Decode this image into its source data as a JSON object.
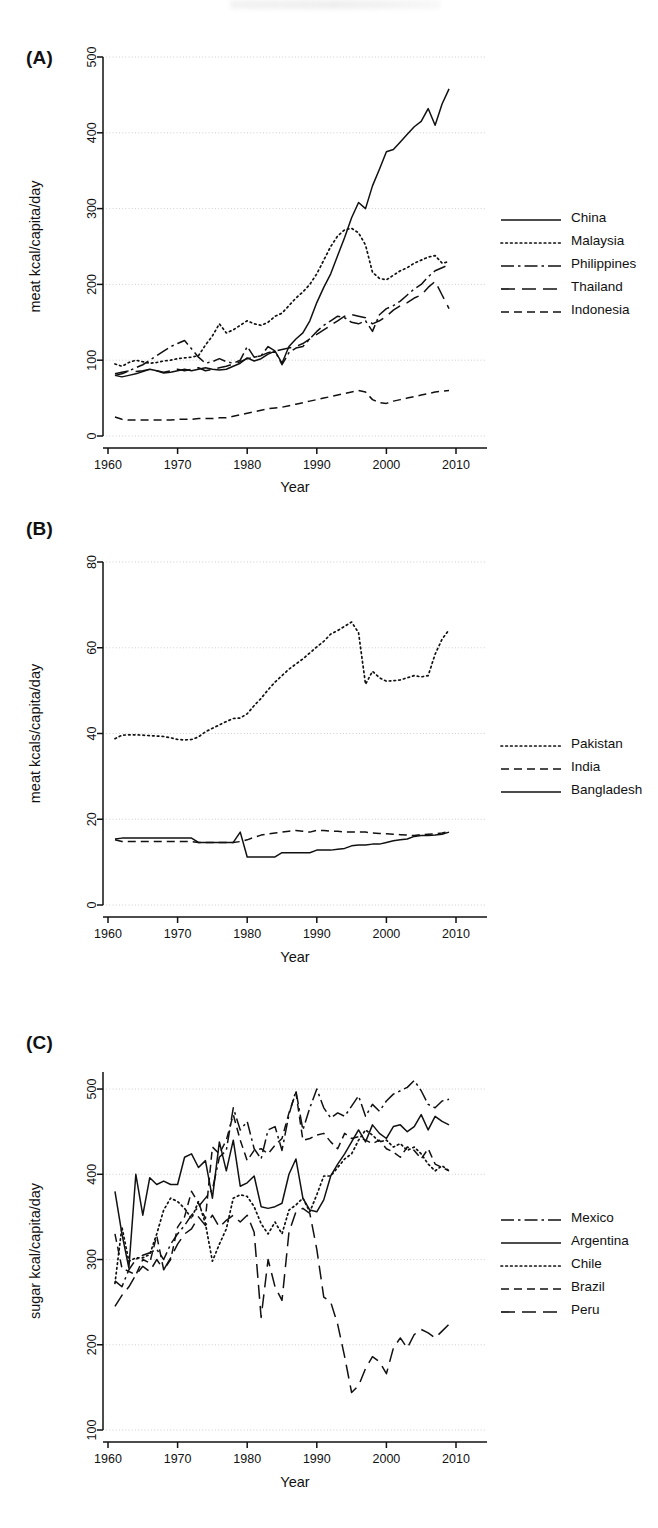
{
  "figure": {
    "panels": [
      "A",
      "B",
      "C"
    ],
    "shared_xlabel": "Year",
    "x_ticks": [
      1960,
      1970,
      1980,
      1990,
      2000,
      2010
    ],
    "line_color": "#111111"
  },
  "panel_a": {
    "tag": "(A)",
    "legend": [
      {
        "label": "China",
        "style": "solid"
      },
      {
        "label": "Malaysia",
        "style": "dotted"
      },
      {
        "label": "Philippines",
        "style": "dash-dot"
      },
      {
        "label": "Thailand",
        "style": "long-dash"
      },
      {
        "label": "Indonesia",
        "style": "dashed"
      }
    ]
  },
  "panel_b": {
    "tag": "(B)",
    "legend": [
      {
        "label": "Pakistan",
        "style": "dotted"
      },
      {
        "label": "India",
        "style": "dashed"
      },
      {
        "label": "Bangladesh",
        "style": "solid"
      }
    ]
  },
  "panel_c": {
    "tag": "(C)",
    "legend": [
      {
        "label": "Mexico",
        "style": "dash-dot"
      },
      {
        "label": "Argentina",
        "style": "solid"
      },
      {
        "label": "Chile",
        "style": "dotted"
      },
      {
        "label": "Brazil",
        "style": "dashed"
      },
      {
        "label": "Peru",
        "style": "long-dash"
      }
    ]
  },
  "chart_data": [
    {
      "type": "line",
      "panel": "A",
      "title": "",
      "xlabel": "Year",
      "ylabel": "meat kcal/capita/day",
      "xlim": [
        1960,
        2012
      ],
      "ylim": [
        0,
        500
      ],
      "xticks": [
        1960,
        1970,
        1980,
        1990,
        2000,
        2010
      ],
      "yticks": [
        0,
        100,
        200,
        300,
        400,
        500
      ],
      "grid": true,
      "legend_position": "right",
      "x": [
        1961,
        1962,
        1963,
        1964,
        1965,
        1966,
        1967,
        1968,
        1969,
        1970,
        1971,
        1972,
        1973,
        1974,
        1975,
        1976,
        1977,
        1978,
        1979,
        1980,
        1981,
        1982,
        1983,
        1984,
        1985,
        1986,
        1987,
        1988,
        1989,
        1990,
        1991,
        1992,
        1993,
        1994,
        1995,
        1996,
        1997,
        1998,
        1999,
        2000,
        2001,
        2002,
        2003,
        2004,
        2005,
        2006,
        2007,
        2008,
        2009
      ],
      "series": [
        {
          "name": "China",
          "style": "solid",
          "values": [
            80,
            78,
            80,
            82,
            85,
            88,
            86,
            83,
            84,
            86,
            88,
            86,
            88,
            90,
            88,
            87,
            88,
            92,
            96,
            103,
            99,
            102,
            108,
            112,
            96,
            118,
            128,
            136,
            152,
            176,
            196,
            214,
            238,
            262,
            288,
            308,
            300,
            330,
            352,
            375,
            378,
            388,
            398,
            408,
            415,
            432,
            410,
            438,
            458
          ]
        },
        {
          "name": "Malaysia",
          "style": "dotted",
          "values": [
            95,
            92,
            97,
            100,
            98,
            96,
            97,
            99,
            100,
            102,
            103,
            104,
            106,
            120,
            132,
            148,
            136,
            140,
            146,
            152,
            148,
            146,
            150,
            158,
            162,
            172,
            182,
            190,
            200,
            214,
            232,
            250,
            264,
            272,
            274,
            268,
            252,
            216,
            208,
            206,
            212,
            218,
            222,
            228,
            232,
            236,
            238,
            228,
            230
          ]
        },
        {
          "name": "Philippines",
          "style": "dash-dot",
          "values": [
            80,
            82,
            86,
            90,
            94,
            100,
            106,
            112,
            118,
            122,
            126,
            115,
            104,
            96,
            98,
            102,
            98,
            96,
            100,
            118,
            104,
            106,
            118,
            112,
            94,
            110,
            116,
            118,
            128,
            138,
            146,
            152,
            158,
            156,
            150,
            148,
            152,
            138,
            160,
            168,
            172,
            178,
            186,
            194,
            200,
            210,
            218,
            222,
            226
          ]
        },
        {
          "name": "Thailand",
          "style": "long-dash",
          "values": [
            82,
            84,
            86,
            85,
            86,
            88,
            86,
            84,
            86,
            88,
            86,
            88,
            90,
            86,
            88,
            90,
            92,
            95,
            98,
            102,
            104,
            106,
            110,
            112,
            114,
            116,
            118,
            122,
            128,
            134,
            140,
            146,
            152,
            158,
            160,
            158,
            156,
            148,
            152,
            158,
            166,
            172,
            176,
            182,
            186,
            196,
            204,
            186,
            168
          ]
        },
        {
          "name": "Indonesia",
          "style": "dashed",
          "values": [
            25,
            22,
            21,
            21,
            21,
            21,
            21,
            21,
            21,
            22,
            22,
            22,
            23,
            23,
            23,
            24,
            24,
            26,
            28,
            30,
            32,
            34,
            36,
            37,
            38,
            40,
            42,
            44,
            46,
            48,
            50,
            52,
            54,
            56,
            58,
            60,
            58,
            48,
            44,
            43,
            46,
            48,
            50,
            52,
            54,
            56,
            58,
            59,
            60
          ]
        }
      ]
    },
    {
      "type": "line",
      "panel": "B",
      "title": "",
      "xlabel": "Year",
      "ylabel": "meat kcals/capita/day",
      "xlim": [
        1960,
        2012
      ],
      "ylim": [
        0,
        80
      ],
      "xticks": [
        1960,
        1970,
        1980,
        1990,
        2000,
        2010
      ],
      "yticks": [
        0,
        20,
        40,
        60,
        80
      ],
      "grid": true,
      "legend_position": "right",
      "x": [
        1961,
        1962,
        1963,
        1964,
        1965,
        1966,
        1967,
        1968,
        1969,
        1970,
        1971,
        1972,
        1973,
        1974,
        1975,
        1976,
        1977,
        1978,
        1979,
        1980,
        1981,
        1982,
        1983,
        1984,
        1985,
        1986,
        1987,
        1988,
        1989,
        1990,
        1991,
        1992,
        1993,
        1994,
        1995,
        1996,
        1997,
        1998,
        1999,
        2000,
        2001,
        2002,
        2003,
        2004,
        2005,
        2006,
        2007,
        2008,
        2009
      ],
      "series": [
        {
          "name": "Pakistan",
          "style": "dotted",
          "values": [
            38.8,
            39.6,
            39.7,
            39.7,
            39.6,
            39.5,
            39.4,
            39.3,
            39.0,
            38.6,
            38.5,
            38.6,
            39.2,
            40.4,
            41.2,
            42.0,
            42.8,
            43.5,
            43.6,
            44.6,
            46.5,
            48.2,
            50.2,
            52.0,
            53.5,
            55.0,
            56.2,
            57.4,
            58.8,
            60.2,
            61.5,
            63.2,
            64.0,
            65.0,
            66.0,
            63.5,
            51.5,
            54.5,
            53.0,
            52.2,
            52.3,
            52.5,
            53.0,
            53.5,
            53.2,
            53.5,
            58.5,
            62.0,
            64.2
          ]
        },
        {
          "name": "India",
          "style": "dashed",
          "values": [
            15.2,
            14.8,
            14.8,
            14.8,
            14.8,
            14.8,
            14.8,
            14.8,
            14.8,
            14.8,
            14.8,
            14.8,
            14.6,
            14.6,
            14.6,
            14.6,
            14.6,
            14.6,
            14.8,
            15.2,
            15.8,
            16.3,
            16.6,
            16.8,
            17.0,
            17.2,
            17.4,
            17.2,
            17.0,
            17.4,
            17.4,
            17.2,
            17.2,
            17.0,
            17.0,
            17.0,
            17.0,
            16.8,
            16.7,
            16.6,
            16.5,
            16.4,
            16.3,
            16.2,
            16.4,
            16.5,
            16.6,
            16.8,
            17.2
          ]
        },
        {
          "name": "Bangladesh",
          "style": "solid",
          "values": [
            15.4,
            15.6,
            15.6,
            15.6,
            15.6,
            15.6,
            15.6,
            15.6,
            15.6,
            15.6,
            15.6,
            15.6,
            14.6,
            14.6,
            14.6,
            14.6,
            14.6,
            14.6,
            17.0,
            11.2,
            11.2,
            11.2,
            11.2,
            11.2,
            12.2,
            12.2,
            12.2,
            12.2,
            12.2,
            12.8,
            12.8,
            12.8,
            13.0,
            13.2,
            13.8,
            14.0,
            14.0,
            14.2,
            14.2,
            14.6,
            15.0,
            15.2,
            15.4,
            16.0,
            16.2,
            16.2,
            16.3,
            16.5,
            17.0
          ]
        }
      ]
    },
    {
      "type": "line",
      "panel": "C",
      "title": "",
      "xlabel": "Year",
      "ylabel": "sugar kcal/capita/day",
      "xlim": [
        1960,
        2012
      ],
      "ylim": [
        100,
        520
      ],
      "xticks": [
        1960,
        1970,
        1980,
        1990,
        2000,
        2010
      ],
      "yticks": [
        100,
        200,
        300,
        400,
        500
      ],
      "grid": true,
      "legend_position": "right",
      "x": [
        1961,
        1962,
        1963,
        1964,
        1965,
        1966,
        1967,
        1968,
        1969,
        1970,
        1971,
        1972,
        1973,
        1974,
        1975,
        1976,
        1977,
        1978,
        1979,
        1980,
        1981,
        1982,
        1983,
        1984,
        1985,
        1986,
        1987,
        1988,
        1989,
        1990,
        1991,
        1992,
        1993,
        1994,
        1995,
        1996,
        1997,
        1998,
        1999,
        2000,
        2001,
        2002,
        2003,
        2004,
        2005,
        2006,
        2007,
        2008,
        2009
      ],
      "series": [
        {
          "name": "Mexico",
          "style": "dash-dot",
          "values": [
            275,
            268,
            288,
            300,
            305,
            308,
            312,
            300,
            318,
            330,
            340,
            352,
            362,
            372,
            382,
            420,
            428,
            478,
            452,
            462,
            430,
            418,
            452,
            456,
            428,
            470,
            498,
            452,
            478,
            500,
            478,
            466,
            472,
            468,
            480,
            492,
            468,
            482,
            474,
            486,
            494,
            498,
            502,
            510,
            498,
            482,
            478,
            486,
            488
          ]
        },
        {
          "name": "Argentina",
          "style": "solid",
          "values": [
            380,
            330,
            290,
            400,
            352,
            396,
            388,
            392,
            388,
            388,
            420,
            424,
            408,
            416,
            372,
            438,
            404,
            440,
            386,
            390,
            398,
            362,
            360,
            362,
            366,
            400,
            418,
            372,
            358,
            356,
            370,
            398,
            412,
            424,
            438,
            452,
            438,
            458,
            448,
            442,
            456,
            458,
            450,
            456,
            470,
            452,
            468,
            462,
            458
          ]
        },
        {
          "name": "Chile",
          "style": "dotted",
          "values": [
            272,
            338,
            298,
            302,
            302,
            306,
            330,
            358,
            372,
            368,
            360,
            348,
            368,
            342,
            298,
            318,
            336,
            372,
            376,
            374,
            362,
            342,
            330,
            344,
            330,
            358,
            364,
            372,
            356,
            376,
            398,
            398,
            408,
            418,
            424,
            440,
            452,
            446,
            438,
            440,
            432,
            436,
            428,
            432,
            424,
            412,
            404,
            410,
            404
          ]
        },
        {
          "name": "Brazil",
          "style": "dashed",
          "values": [
            330,
            290,
            286,
            282,
            300,
            296,
            328,
            288,
            300,
            338,
            350,
            380,
            366,
            348,
            432,
            424,
            440,
            470,
            440,
            416,
            428,
            430,
            424,
            434,
            442,
            472,
            496,
            440,
            442,
            446,
            448,
            438,
            430,
            448,
            442,
            444,
            440,
            436,
            440,
            430,
            426,
            420,
            432,
            428,
            418,
            430,
            412,
            408,
            404
          ]
        },
        {
          "name": "Peru",
          "style": "long-dash",
          "values": [
            245,
            258,
            268,
            282,
            292,
            286,
            300,
            288,
            302,
            318,
            330,
            336,
            350,
            340,
            352,
            338,
            346,
            352,
            344,
            352,
            332,
            232,
            300,
            268,
            252,
            332,
            356,
            360,
            354,
            312,
            256,
            250,
            224,
            186,
            144,
            152,
            172,
            186,
            180,
            166,
            196,
            208,
            196,
            212,
            218,
            214,
            208,
            216,
            224
          ]
        }
      ]
    }
  ]
}
